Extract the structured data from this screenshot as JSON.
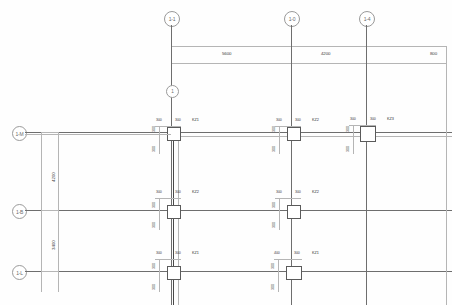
{
  "drawing": {
    "type": "structural-column-layout-plan",
    "title": "",
    "units": "mm"
  },
  "grids": {
    "vertical_top": [
      {
        "label": "1-1",
        "x": 171
      },
      {
        "label": "1-0",
        "x": 291
      },
      {
        "label": "1-4",
        "x": 366
      },
      {
        "label": "1",
        "x": 171
      }
    ],
    "horizontal_left": [
      {
        "label": "1-M",
        "y": 132
      },
      {
        "label": "1-B",
        "y": 210
      },
      {
        "label": "1-L",
        "y": 271
      }
    ]
  },
  "dimensions": {
    "top_chain": [
      {
        "value": "5600",
        "from": "1-1",
        "to": "1-0"
      },
      {
        "value": "4200",
        "from": "1-0",
        "to": "1-4"
      },
      {
        "value": "800",
        "from": "1-4",
        "to": "edge"
      }
    ],
    "left_chain": [
      {
        "value": "4200",
        "from": "1-M",
        "to": "1-B"
      },
      {
        "value": "3400",
        "from": "1-B",
        "to": "1-L"
      }
    ]
  },
  "columns": [
    {
      "tag": "KZ1",
      "w": "300",
      "d": "300",
      "row": "1-M",
      "grid": "1-1"
    },
    {
      "tag": "KZ2",
      "w": "300",
      "d": "300",
      "row": "1-M",
      "grid": "1-0"
    },
    {
      "tag": "KZ3",
      "w": "300",
      "d": "300",
      "row": "1-M",
      "grid": "1-4"
    },
    {
      "tag": "KZ2",
      "w": "300",
      "d": "300",
      "row": "1-B",
      "grid": "1-1"
    },
    {
      "tag": "KZ2",
      "w": "300",
      "d": "300",
      "row": "1-B",
      "grid": "1-0"
    },
    {
      "tag": "KZ1",
      "w": "300",
      "d": "300",
      "row": "1-L",
      "grid": "1-1"
    },
    {
      "tag": "KZ1",
      "w": "400",
      "d": "300",
      "row": "1-L",
      "grid": "1-0"
    }
  ],
  "labels": {
    "dim_300": "300",
    "dim_400": "400",
    "dim_5600": "5600",
    "dim_4200": "4200",
    "dim_800": "800",
    "dim_3400": "3400",
    "tag_kz1": "KZ1",
    "tag_kz2": "KZ2",
    "tag_kz3": "KZ3",
    "bubble_11": "1-1",
    "bubble_10": "1-0",
    "bubble_14": "1-4",
    "bubble_1": "1",
    "bubble_1m": "1-M",
    "bubble_1b": "1-B",
    "bubble_1l": "1-L"
  },
  "colors": {
    "line": "#8d8d8d",
    "line_light": "#b5b5b5",
    "line_heavy": "#4a4a4a",
    "text": "#3c3c3c",
    "background": "#fefefe"
  }
}
